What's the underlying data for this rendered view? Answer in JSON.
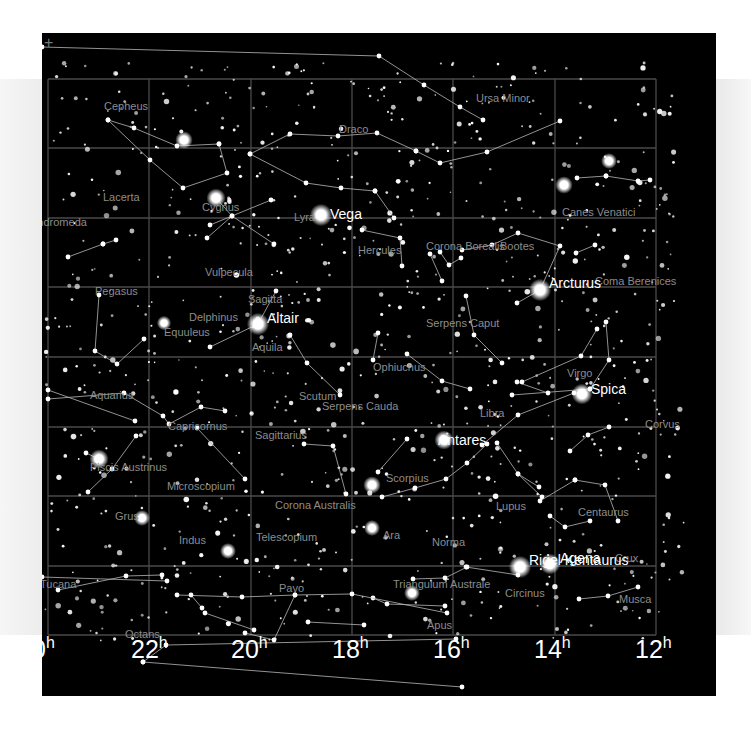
{
  "chart_meta": {
    "title": "Sky map — summer sky, right ascension 24h to 12h",
    "background": "#000000",
    "grid_color": "#4a4a4a",
    "line_color": "#b8b8b8",
    "label_color": "#8c8c8c",
    "star_label_color": "#ffffff"
  },
  "corner_marker": "+",
  "axis": {
    "ra_labels": [
      {
        "value": "0",
        "unit": "h",
        "x": -10
      },
      {
        "value": "22",
        "unit": "h",
        "x": 89
      },
      {
        "value": "20",
        "unit": "h",
        "x": 189
      },
      {
        "value": "18",
        "unit": "h",
        "x": 290
      },
      {
        "value": "16",
        "unit": "h",
        "x": 391
      },
      {
        "value": "14",
        "unit": "h",
        "x": 492
      },
      {
        "value": "12",
        "unit": "h",
        "x": 593
      }
    ]
  },
  "grid": {
    "x": [
      6,
      107,
      209,
      310,
      411,
      513,
      614
    ],
    "y": [
      46,
      115,
      185,
      254,
      324,
      394,
      463,
      533,
      602
    ]
  },
  "constellations": [
    {
      "name": "Cepheus",
      "x": 62,
      "y": 68
    },
    {
      "name": "Draco",
      "x": 297,
      "y": 91
    },
    {
      "name": "Ursa Minor",
      "x": 434,
      "y": 60
    },
    {
      "name": "Lacerta",
      "x": 61,
      "y": 159
    },
    {
      "name": "Cygnus",
      "x": 160,
      "y": 169
    },
    {
      "name": "Lyra",
      "x": 252,
      "y": 179
    },
    {
      "name": "Hercules",
      "x": 316,
      "y": 212
    },
    {
      "name": "Corona Borealis",
      "x": 384,
      "y": 208
    },
    {
      "name": "Bootes",
      "x": 458,
      "y": 208
    },
    {
      "name": "Canes Venatici",
      "x": 520,
      "y": 174
    },
    {
      "name": "Coma Berenices",
      "x": 553,
      "y": 243
    },
    {
      "name": "Vulpecula",
      "x": 163,
      "y": 234
    },
    {
      "name": "Pegasus",
      "x": 53,
      "y": 253
    },
    {
      "name": "Sagitta",
      "x": 206,
      "y": 261
    },
    {
      "name": "Delphinus",
      "x": 147,
      "y": 279
    },
    {
      "name": "Equuleus",
      "x": 122,
      "y": 294
    },
    {
      "name": "Serpens Caput",
      "x": 384,
      "y": 285
    },
    {
      "name": "Aquila",
      "x": 210,
      "y": 309
    },
    {
      "name": "Ophiuchus",
      "x": 331,
      "y": 329
    },
    {
      "name": "Virgo",
      "x": 525,
      "y": 335
    },
    {
      "name": "Aquarius",
      "x": 48,
      "y": 357
    },
    {
      "name": "Scutum",
      "x": 257,
      "y": 358
    },
    {
      "name": "Serpens Cauda",
      "x": 280,
      "y": 368
    },
    {
      "name": "Libra",
      "x": 438,
      "y": 375
    },
    {
      "name": "Corvus",
      "x": 603,
      "y": 386
    },
    {
      "name": "Capricornus",
      "x": 126,
      "y": 388
    },
    {
      "name": "Piscis Austrinus",
      "x": 48,
      "y": 429
    },
    {
      "name": "Sagittarius",
      "x": 213,
      "y": 397
    },
    {
      "name": "Microscopium",
      "x": 125,
      "y": 448
    },
    {
      "name": "Scorpius",
      "x": 344,
      "y": 440
    },
    {
      "name": "Lupus",
      "x": 454,
      "y": 468
    },
    {
      "name": "Centaurus",
      "x": 536,
      "y": 474
    },
    {
      "name": "Grus",
      "x": 73,
      "y": 478
    },
    {
      "name": "Corona Australis",
      "x": 233,
      "y": 467
    },
    {
      "name": "Indus",
      "x": 137,
      "y": 502
    },
    {
      "name": "Telescopium",
      "x": 214,
      "y": 499
    },
    {
      "name": "Ara",
      "x": 341,
      "y": 497
    },
    {
      "name": "Norma",
      "x": 390,
      "y": 504
    },
    {
      "name": "Crux",
      "x": 573,
      "y": 520
    },
    {
      "name": "Tucana",
      "x": -2,
      "y": 546
    },
    {
      "name": "Pavo",
      "x": 237,
      "y": 550
    },
    {
      "name": "Triangulum Australe",
      "x": 351,
      "y": 546
    },
    {
      "name": "Circinus",
      "x": 463,
      "y": 555
    },
    {
      "name": "Musca",
      "x": 577,
      "y": 561
    },
    {
      "name": "Apus",
      "x": 385,
      "y": 587
    },
    {
      "name": "Octans",
      "x": 83,
      "y": 596
    },
    {
      "name": "Andromeda",
      "x": -12,
      "y": 184
    }
  ],
  "named_stars": [
    {
      "name": "Vega",
      "x": 288,
      "y": 174
    },
    {
      "name": "Arcturus",
      "x": 507,
      "y": 243
    },
    {
      "name": "Altair",
      "x": 225,
      "y": 278
    },
    {
      "name": "Spica",
      "x": 549,
      "y": 349
    },
    {
      "name": "Antares",
      "x": 396,
      "y": 400
    },
    {
      "name": "Rigel Kentaurus",
      "x": 487,
      "y": 520
    },
    {
      "name": "Agena",
      "x": 518,
      "y": 518
    }
  ],
  "bright_stars": [
    [
      279,
      182,
      7
    ],
    [
      498,
      257,
      7
    ],
    [
      216,
      291,
      7
    ],
    [
      540,
      361,
      6.5
    ],
    [
      402,
      407,
      6
    ],
    [
      478,
      534,
      7
    ],
    [
      508,
      531,
      6.5
    ],
    [
      174,
      165,
      6
    ],
    [
      57,
      426,
      6
    ],
    [
      142,
      107,
      5.5
    ],
    [
      522,
      152,
      5.5
    ],
    [
      567,
      128,
      5
    ],
    [
      330,
      452,
      5.5
    ],
    [
      330,
      495,
      5
    ],
    [
      186,
      518,
      5
    ],
    [
      100,
      485,
      5
    ],
    [
      122,
      290,
      4.5
    ],
    [
      370,
      560,
      5
    ]
  ],
  "lines": [
    [
      [
        0,
        14
      ],
      [
        337,
        23
      ],
      [
        382,
        52
      ],
      [
        418,
        74
      ],
      [
        441,
        87
      ]
    ],
    [
      [
        66,
        87
      ],
      [
        92,
        95
      ],
      [
        135,
        113
      ],
      [
        177,
        111
      ]
    ],
    [
      [
        66,
        87
      ],
      [
        108,
        127
      ],
      [
        141,
        155
      ],
      [
        185,
        140
      ],
      [
        177,
        111
      ]
    ],
    [
      [
        208,
        121
      ],
      [
        248,
        101
      ],
      [
        296,
        103
      ],
      [
        335,
        100
      ],
      [
        374,
        118
      ]
    ],
    [
      [
        208,
        121
      ],
      [
        264,
        150
      ],
      [
        299,
        155
      ],
      [
        333,
        158
      ]
    ],
    [
      [
        333,
        158
      ],
      [
        352,
        185
      ]
    ],
    [
      [
        374,
        118
      ],
      [
        398,
        130
      ],
      [
        445,
        119
      ],
      [
        518,
        88
      ]
    ],
    [
      [
        168,
        192
      ],
      [
        229,
        167
      ]
    ],
    [
      [
        174,
        165
      ],
      [
        190,
        183
      ],
      [
        232,
        211
      ]
    ],
    [
      [
        190,
        183
      ],
      [
        165,
        205
      ]
    ],
    [
      [
        57,
        262
      ],
      [
        53,
        318
      ],
      [
        75,
        331
      ],
      [
        102,
        306
      ]
    ],
    [
      [
        26,
        224
      ],
      [
        61,
        211
      ]
    ],
    [
      [
        61,
        211
      ],
      [
        74,
        207
      ]
    ],
    [
      [
        248,
        302
      ],
      [
        265,
        330
      ],
      [
        298,
        362
      ]
    ],
    [
      [
        216,
        291
      ],
      [
        234,
        258
      ]
    ],
    [
      [
        216,
        291
      ],
      [
        168,
        314
      ]
    ],
    [
      [
        6,
        366
      ],
      [
        82,
        360
      ],
      [
        121,
        383
      ],
      [
        127,
        391
      ],
      [
        159,
        374
      ],
      [
        183,
        378
      ]
    ],
    [
      [
        6,
        357
      ],
      [
        93,
        388
      ]
    ],
    [
      [
        94,
        403
      ],
      [
        70,
        436
      ],
      [
        46,
        459
      ]
    ],
    [
      [
        44,
        420
      ],
      [
        57,
        426
      ]
    ],
    [
      [
        155,
        395
      ],
      [
        203,
        446
      ]
    ],
    [
      [
        262,
        411
      ],
      [
        291,
        413
      ],
      [
        304,
        461
      ]
    ],
    [
      [
        336,
        439
      ],
      [
        365,
        406
      ]
    ],
    [
      [
        340,
        464
      ],
      [
        373,
        455
      ],
      [
        404,
        446
      ],
      [
        425,
        430
      ],
      [
        445,
        411
      ]
    ],
    [
      [
        440,
        412
      ],
      [
        476,
        382
      ],
      [
        532,
        360
      ]
    ],
    [
      [
        470,
        362
      ],
      [
        548,
        356
      ]
    ],
    [
      [
        475,
        349
      ],
      [
        506,
        360
      ]
    ],
    [
      [
        480,
        349
      ],
      [
        539,
        323
      ],
      [
        555,
        296
      ]
    ],
    [
      [
        548,
        356
      ],
      [
        567,
        327
      ],
      [
        564,
        289
      ]
    ],
    [
      [
        528,
        418
      ],
      [
        546,
        402
      ],
      [
        567,
        394
      ]
    ],
    [
      [
        498,
        257
      ],
      [
        518,
        213
      ],
      [
        476,
        200
      ],
      [
        450,
        212
      ],
      [
        420,
        217
      ]
    ],
    [
      [
        498,
        257
      ],
      [
        475,
        270
      ]
    ],
    [
      [
        534,
        220
      ],
      [
        553,
        212
      ]
    ],
    [
      [
        564,
        143
      ],
      [
        596,
        148
      ],
      [
        608,
        147
      ]
    ],
    [
      [
        535,
        145
      ],
      [
        564,
        143
      ]
    ],
    [
      [
        398,
        219
      ],
      [
        407,
        232
      ],
      [
        419,
        225
      ]
    ],
    [
      [
        320,
        197
      ],
      [
        358,
        205
      ],
      [
        360,
        233
      ]
    ],
    [
      [
        388,
        221
      ],
      [
        400,
        248
      ]
    ],
    [
      [
        424,
        263
      ],
      [
        432,
        302
      ],
      [
        460,
        330
      ]
    ],
    [
      [
        336,
        300
      ],
      [
        331,
        327
      ]
    ],
    [
      [
        365,
        321
      ],
      [
        400,
        348
      ],
      [
        428,
        356
      ]
    ],
    [
      [
        455,
        410
      ],
      [
        476,
        441
      ],
      [
        500,
        464
      ]
    ],
    [
      [
        476,
        441
      ],
      [
        497,
        454
      ]
    ],
    [
      [
        533,
        447
      ],
      [
        563,
        452
      ],
      [
        576,
        488
      ]
    ],
    [
      [
        508,
        483
      ],
      [
        523,
        494
      ],
      [
        548,
        488
      ]
    ],
    [
      [
        498,
        468
      ],
      [
        533,
        447
      ]
    ],
    [
      [
        476,
        542
      ],
      [
        424,
        534
      ]
    ],
    [
      [
        371,
        546
      ],
      [
        403,
        545
      ],
      [
        425,
        534
      ]
    ],
    [
      [
        331,
        565
      ],
      [
        345,
        571
      ],
      [
        403,
        573
      ]
    ],
    [
      [
        16,
        557
      ],
      [
        84,
        543
      ],
      [
        120,
        542
      ]
    ],
    [
      [
        0,
        544
      ],
      [
        125,
        548
      ]
    ],
    [
      [
        135,
        562
      ],
      [
        200,
        564
      ],
      [
        253,
        562
      ],
      [
        310,
        561
      ],
      [
        405,
        580
      ]
    ],
    [
      [
        149,
        562
      ],
      [
        160,
        575
      ]
    ],
    [
      [
        101,
        629
      ],
      [
        124,
        612
      ],
      [
        414,
        606
      ]
    ],
    [
      [
        101,
        629
      ],
      [
        420,
        654
      ]
    ],
    [
      [
        163,
        580
      ],
      [
        212,
        597
      ]
    ],
    [
      [
        253,
        562
      ],
      [
        232,
        607
      ],
      [
        203,
        600
      ]
    ],
    [
      [
        537,
        566
      ],
      [
        566,
        563
      ],
      [
        596,
        554
      ]
    ],
    [
      [
        266,
        589
      ],
      [
        322,
        592
      ]
    ]
  ]
}
